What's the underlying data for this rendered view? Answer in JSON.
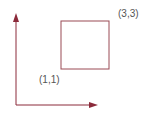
{
  "diagram": {
    "type": "coordinate-rectangle",
    "colors": {
      "axis": "#8b2a3a",
      "rectangle": "#9a4a55",
      "label": "#555555",
      "background": "#ffffff"
    },
    "axes": {
      "origin": {
        "x": 16,
        "y": 105
      },
      "y_axis_tip": {
        "x": 16,
        "y": 13
      },
      "x_axis_tip": {
        "x": 98,
        "y": 105
      }
    },
    "rectangle": {
      "x": 61,
      "y": 21,
      "width": 48,
      "height": 48
    },
    "labels": [
      {
        "id": "bottom-left",
        "text": "(1,1)",
        "x": 39,
        "y": 75
      },
      {
        "id": "top-right",
        "text": "(3,3)",
        "x": 118,
        "y": 9
      }
    ]
  }
}
